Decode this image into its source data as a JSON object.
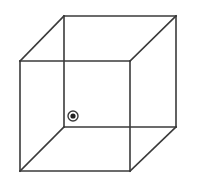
{
  "diagram": {
    "title": "Necker cube",
    "colors": {
      "stroke": "#3a3a3a",
      "background": "#ffffff",
      "marker": "#222222"
    },
    "front_face": {
      "x1": 20,
      "y1": 61,
      "x2": 130,
      "y2": 171
    },
    "back_face": {
      "x1": 64,
      "y1": 16,
      "x2": 176,
      "y2": 127
    },
    "marker": {
      "cx": 73,
      "cy": 116,
      "outer_r": 5,
      "inner_r": 2.6,
      "label": "fixation point"
    }
  }
}
